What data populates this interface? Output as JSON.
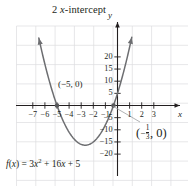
{
  "figure": {
    "title_prefix": "2 ",
    "title_var": "x",
    "title_suffix": "-intercept",
    "equation_lhs_f": "f",
    "equation_lhs_paren_open": "(",
    "equation_lhs_var": "x",
    "equation_lhs_paren_close": ")",
    "equation_eq": " = 3",
    "equation_x1": "x",
    "equation_pow": "2",
    "equation_mid": " + 16",
    "equation_x2": "x",
    "equation_tail": " + 5",
    "curve_color": "#6d6e71",
    "axis_color": "#231f20",
    "grid_color": "#dcdddf",
    "text_color": "#231f20"
  },
  "axes": {
    "x_label": "x",
    "y_label": "y",
    "x_ticks": [
      {
        "value": -7,
        "label": "−7"
      },
      {
        "value": -6,
        "label": "−6"
      },
      {
        "value": -5,
        "label": "−5"
      },
      {
        "value": -4,
        "label": "−4"
      },
      {
        "value": -3,
        "label": "−3"
      },
      {
        "value": -2,
        "label": "−2"
      },
      {
        "value": -1,
        "label": "−1"
      },
      {
        "value": 1,
        "label": "1"
      },
      {
        "value": 2,
        "label": "2"
      },
      {
        "value": 3,
        "label": "3"
      }
    ],
    "y_ticks": [
      {
        "value": 20,
        "label": "20"
      },
      {
        "value": 15,
        "label": "15"
      },
      {
        "value": 10,
        "label": "10"
      },
      {
        "value": 5,
        "label": "5"
      },
      {
        "value": -5,
        "label": "−5"
      },
      {
        "value": -10,
        "label": "−10"
      },
      {
        "value": -15,
        "label": "−15"
      },
      {
        "value": -20,
        "label": "−20"
      }
    ],
    "xlim": [
      -8.2,
      4.2
    ],
    "ylim": [
      -23.5,
      24.5
    ]
  },
  "annotations": {
    "intercept_left": "(−5, 0)",
    "intercept_right_open": "(",
    "intercept_right_minus": "−",
    "intercept_right_num": "1",
    "intercept_right_den": "3",
    "intercept_right_close": ", 0)"
  },
  "chart_data": {
    "type": "line",
    "title": "2 x-intercept",
    "xlabel": "x",
    "ylabel": "y",
    "function": "f(x) = 3x^2 + 16x + 5",
    "coefficients": {
      "a": 3,
      "b": 16,
      "c": 5
    },
    "vertex": {
      "x": -2.667,
      "y": -16.333
    },
    "roots": [
      -5,
      -0.3333
    ],
    "y_intercept": 5,
    "xlim": [
      -8.2,
      4.2
    ],
    "ylim": [
      -23.5,
      24.5
    ],
    "xticks": [
      -7,
      -6,
      -5,
      -4,
      -3,
      -2,
      -1,
      1,
      2,
      3
    ],
    "yticks": [
      20,
      15,
      10,
      5,
      -5,
      -10,
      -15,
      -20
    ],
    "grid": true,
    "legend": "none",
    "annotations": [
      {
        "text": "(−5, 0)",
        "x": -5,
        "y": 0
      },
      {
        "text": "(−1/3, 0)",
        "x": -0.3333,
        "y": 0
      }
    ],
    "points": [
      {
        "x": -7.0,
        "y": 40.0
      },
      {
        "x": -6.5,
        "y": 27.75
      },
      {
        "x": -6.0,
        "y": 17.0
      },
      {
        "x": -5.5,
        "y": 7.75
      },
      {
        "x": -5.0,
        "y": 0.0
      },
      {
        "x": -4.5,
        "y": -6.25
      },
      {
        "x": -4.0,
        "y": -11.0
      },
      {
        "x": -3.5,
        "y": -14.25
      },
      {
        "x": -3.0,
        "y": -16.0
      },
      {
        "x": -2.667,
        "y": -16.333
      },
      {
        "x": -2.5,
        "y": -16.25
      },
      {
        "x": -2.0,
        "y": -15.0
      },
      {
        "x": -1.5,
        "y": -12.25
      },
      {
        "x": -1.0,
        "y": -8.0
      },
      {
        "x": -0.5,
        "y": -2.25
      },
      {
        "x": -0.333,
        "y": 0.0
      },
      {
        "x": 0.0,
        "y": 5.0
      },
      {
        "x": 0.5,
        "y": 13.75
      },
      {
        "x": 1.0,
        "y": 24.0
      }
    ]
  }
}
